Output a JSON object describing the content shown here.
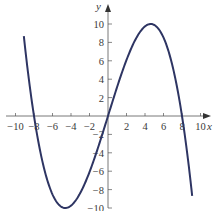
{
  "chart_data": {
    "type": "line",
    "title": "",
    "xlabel": "x",
    "ylabel": "y",
    "xlim": [
      -10,
      10
    ],
    "ylim": [
      -10,
      10
    ],
    "grid": false,
    "x_ticks": [
      -10,
      -8,
      -6,
      -4,
      -2,
      2,
      4,
      6,
      8,
      10
    ],
    "y_ticks": [
      -10,
      -8,
      -6,
      -4,
      -2,
      2,
      4,
      6,
      8,
      10
    ],
    "x_tick_labels": [
      "−10",
      "−8",
      "−6",
      "−4",
      "−2",
      "2",
      "4",
      "6",
      "8",
      "10"
    ],
    "y_tick_labels": [
      "−10",
      "−8",
      "−6",
      "−4",
      "−2",
      "2",
      "4",
      "6",
      "8",
      "10"
    ],
    "series": [
      {
        "name": "cubic",
        "description": "Cubic curve with roots near x = -8, 0, 8; local min about -10 near x = -4.6, local max about 10 near x = 4.6",
        "x": [
          -9.1,
          -8.5,
          -8,
          -7,
          -6,
          -5,
          -4.6,
          -4,
          -3,
          -2,
          -1,
          0,
          1,
          2,
          3,
          4,
          4.6,
          5,
          6,
          7,
          8,
          8.5,
          9.1
        ],
        "y": [
          10,
          3.5,
          0,
          -5.3,
          -8.5,
          -9.9,
          -10,
          -9.8,
          -8.4,
          -6.1,
          -3.2,
          0,
          3.2,
          6.1,
          8.4,
          9.8,
          10,
          9.9,
          8.5,
          5.3,
          0,
          -3.5,
          -10
        ]
      }
    ],
    "colors": {
      "curve": "#2e3563",
      "axes": "#555555",
      "text": "#3a3a3a"
    }
  }
}
